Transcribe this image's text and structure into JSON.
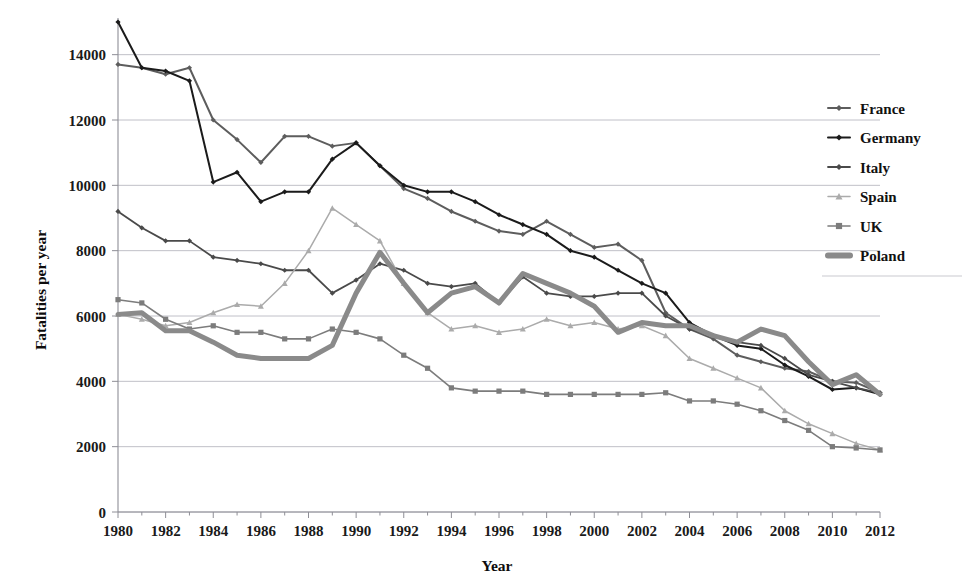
{
  "chart_data": {
    "type": "line",
    "title": "",
    "xlabel": "Year",
    "ylabel": "Fatalities per year",
    "xlim": [
      1980,
      2012
    ],
    "ylim": [
      0,
      15000
    ],
    "yticks": [
      0,
      2000,
      4000,
      6000,
      8000,
      10000,
      12000,
      14000
    ],
    "ytick_labels": [
      "0",
      "2000",
      "4000",
      "6000",
      "8000",
      "10000",
      "12000",
      "14000"
    ],
    "xticks": [
      1980,
      1982,
      1984,
      1986,
      1988,
      1990,
      1992,
      1994,
      1996,
      1998,
      2000,
      2002,
      2004,
      2006,
      2008,
      2010,
      2012
    ],
    "xtick_labels": [
      "1980",
      "1982",
      "1984",
      "1986",
      "1988",
      "1990",
      "1992",
      "1994",
      "1996",
      "1998",
      "2000",
      "2002",
      "2004",
      "2006",
      "2008",
      "2010",
      "2012"
    ],
    "grid": true,
    "legend_position": "right",
    "x": [
      1980,
      1981,
      1982,
      1983,
      1984,
      1985,
      1986,
      1987,
      1988,
      1989,
      1990,
      1991,
      1992,
      1993,
      1994,
      1995,
      1996,
      1997,
      1998,
      1999,
      2000,
      2001,
      2002,
      2003,
      2004,
      2005,
      2006,
      2007,
      2008,
      2009,
      2010,
      2011,
      2012
    ],
    "series": [
      {
        "name": "France",
        "color": "#5d5d5d",
        "marker": "diamond",
        "width": 2.0,
        "values": [
          13700,
          13600,
          13400,
          13600,
          12000,
          11400,
          10700,
          11500,
          11500,
          11200,
          11300,
          10600,
          9900,
          9600,
          9200,
          8900,
          8600,
          8500,
          8900,
          8500,
          8100,
          8200,
          7700,
          6100,
          5600,
          5300,
          4800,
          4600,
          4400,
          4300,
          4000,
          3960,
          3650
        ]
      },
      {
        "name": "Germany",
        "color": "#1b1b1b",
        "marker": "diamond",
        "width": 2.0,
        "values": [
          15000,
          13600,
          13500,
          13200,
          10100,
          10400,
          9500,
          9800,
          9800,
          10800,
          11300,
          10600,
          10000,
          9800,
          9800,
          9500,
          9100,
          8800,
          8500,
          8000,
          7800,
          7400,
          7000,
          6700,
          5800,
          5400,
          5100,
          5000,
          4500,
          4150,
          3750,
          3800,
          3600
        ]
      },
      {
        "name": "Italy",
        "color": "#4a4a4a",
        "marker": "diamond",
        "width": 1.8,
        "values": [
          9200,
          8700,
          8300,
          8300,
          7800,
          7700,
          7600,
          7400,
          7400,
          6700,
          7100,
          7600,
          7400,
          7000,
          6900,
          7000,
          6400,
          7200,
          6700,
          6600,
          6600,
          6700,
          6700,
          6000,
          5600,
          5400,
          5200,
          5100,
          4700,
          4200,
          4000,
          3800,
          3650
        ]
      },
      {
        "name": "Spain",
        "color": "#ababab",
        "marker": "triangle",
        "width": 1.5,
        "values": [
          6050,
          5900,
          5700,
          5800,
          6100,
          6350,
          6300,
          7000,
          8000,
          9300,
          8800,
          8300,
          7000,
          6100,
          5600,
          5700,
          5500,
          5600,
          5900,
          5700,
          5800,
          5600,
          5700,
          5400,
          4700,
          4400,
          4100,
          3800,
          3100,
          2700,
          2400,
          2100,
          1900
        ]
      },
      {
        "name": "UK",
        "color": "#7c7c7c",
        "marker": "square",
        "width": 1.6,
        "values": [
          6500,
          6400,
          5900,
          5600,
          5700,
          5500,
          5500,
          5300,
          5300,
          5600,
          5500,
          5300,
          4800,
          4400,
          3800,
          3700,
          3700,
          3700,
          3600,
          3600,
          3600,
          3600,
          3600,
          3650,
          3400,
          3400,
          3300,
          3100,
          2800,
          2500,
          2000,
          1960,
          1900
        ]
      },
      {
        "name": "Poland",
        "color": "#8a8a8a",
        "marker": "none",
        "width": 5.0,
        "values": [
          6050,
          6100,
          5550,
          5550,
          5200,
          4800,
          4700,
          4700,
          4700,
          5100,
          6700,
          7950,
          7000,
          6100,
          6700,
          6900,
          6400,
          7300,
          7000,
          6700,
          6300,
          5500,
          5800,
          5700,
          5700,
          5400,
          5200,
          5600,
          5400,
          4600,
          3900,
          4200,
          3600
        ]
      }
    ]
  },
  "axes": {
    "ylabel": "Fatalities per year",
    "xlabel": "Year"
  },
  "legend": {
    "items": [
      {
        "label": "France"
      },
      {
        "label": "Germany"
      },
      {
        "label": "Italy"
      },
      {
        "label": "Spain"
      },
      {
        "label": "UK"
      },
      {
        "label": "Poland"
      }
    ]
  }
}
